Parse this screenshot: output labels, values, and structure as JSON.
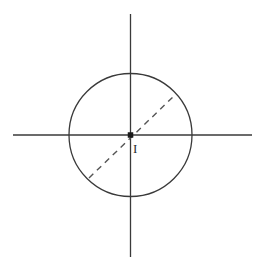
{
  "figure": {
    "type": "geometry-diagram",
    "width": 263,
    "height": 271,
    "background_color": "#ffffff",
    "stroke_color": "#3a3a3a",
    "dash_color": "#555555",
    "label_color": "#2b2b2b"
  },
  "axes": {
    "origin": {
      "x": 130.5,
      "y": 135
    },
    "horizontal": {
      "name": "horizontal-axis",
      "x_start": 13,
      "x_end": 252,
      "y": 135,
      "stroke_width": 1.3
    },
    "vertical": {
      "name": "vertical-axis",
      "x": 130.5,
      "y_start": 14,
      "y_end": 257,
      "stroke_width": 1.3
    }
  },
  "circle": {
    "name": "main-circle",
    "center_x": 130.5,
    "center_y": 135,
    "radius": 61.5,
    "stroke_width": 1.3,
    "fill": "none"
  },
  "dashed_line": {
    "name": "dashed-diameter",
    "x1": 89,
    "y1": 178,
    "x2": 175,
    "y2": 95,
    "stroke_width": 1.4,
    "dash_pattern": "6 5"
  },
  "center_point": {
    "name": "center-point",
    "x": 130.5,
    "y": 135,
    "size": 5.5,
    "label": "I",
    "label_x": 133,
    "label_y": 142
  },
  "chart_data": {
    "type": "scatter",
    "title": "",
    "xlabel": "",
    "ylabel": "",
    "annotations": [
      "I"
    ],
    "points": [
      {
        "label": "I",
        "x": 0,
        "y": 0
      }
    ]
  }
}
